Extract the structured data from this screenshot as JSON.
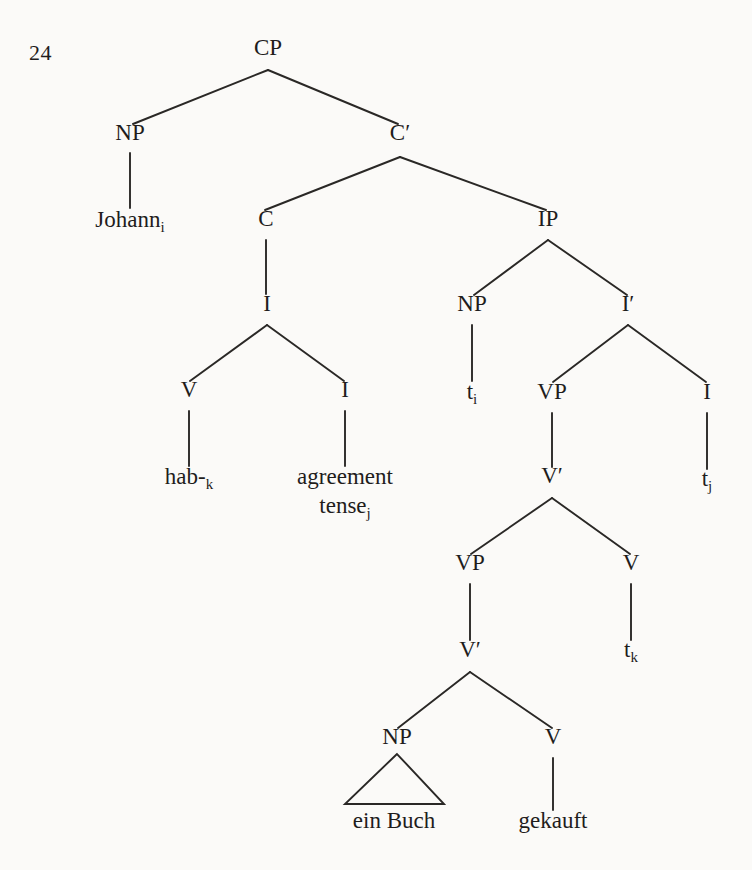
{
  "page": {
    "number": "24",
    "width": 752,
    "height": 870,
    "background_color": "#fbfaf8",
    "ink_color": "#1f1d1c"
  },
  "figure": {
    "type": "syntax-tree",
    "sentence": "Johann hab- agreement tense ein Buch gekauft",
    "nodes": [
      {
        "id": "cp",
        "label": "CP",
        "sub": "",
        "x": 268,
        "y": 55,
        "kind": "category"
      },
      {
        "id": "np1",
        "label": "NP",
        "sub": "",
        "x": 130,
        "y": 140,
        "kind": "category"
      },
      {
        "id": "johann",
        "label": "Johann",
        "sub": "i",
        "x": 130,
        "y": 227,
        "kind": "leaf"
      },
      {
        "id": "cbar",
        "label": "C′",
        "sub": "",
        "x": 400,
        "y": 140,
        "kind": "category"
      },
      {
        "id": "c",
        "label": "C",
        "sub": "",
        "x": 266,
        "y": 226,
        "kind": "category"
      },
      {
        "id": "ip",
        "label": "IP",
        "sub": "",
        "x": 548,
        "y": 226,
        "kind": "category"
      },
      {
        "id": "i1",
        "label": "I",
        "sub": "",
        "x": 267,
        "y": 311,
        "kind": "category"
      },
      {
        "id": "v1",
        "label": "V",
        "sub": "",
        "x": 189,
        "y": 397,
        "kind": "category"
      },
      {
        "id": "i2",
        "label": "I",
        "sub": "",
        "x": 345,
        "y": 397,
        "kind": "category"
      },
      {
        "id": "hab",
        "label": "hab-",
        "sub": "k",
        "x": 189,
        "y": 484,
        "kind": "leaf"
      },
      {
        "id": "agreement",
        "label": "agreement",
        "sub": "",
        "x": 345,
        "y": 484,
        "kind": "leaf"
      },
      {
        "id": "tense",
        "label": "tense",
        "sub": "j",
        "x": 345,
        "y": 513,
        "kind": "leaf"
      },
      {
        "id": "np2",
        "label": "NP",
        "sub": "",
        "x": 472,
        "y": 311,
        "kind": "category"
      },
      {
        "id": "ibar",
        "label": "I′",
        "sub": "",
        "x": 628,
        "y": 311,
        "kind": "category"
      },
      {
        "id": "ti",
        "label": "t",
        "sub": "i",
        "x": 472,
        "y": 399,
        "kind": "leaf"
      },
      {
        "id": "vp1",
        "label": "VP",
        "sub": "",
        "x": 552,
        "y": 399,
        "kind": "category"
      },
      {
        "id": "i3",
        "label": "I",
        "sub": "",
        "x": 707,
        "y": 399,
        "kind": "category"
      },
      {
        "id": "tj",
        "label": "t",
        "sub": "j",
        "x": 707,
        "y": 486,
        "kind": "leaf"
      },
      {
        "id": "vbar1",
        "label": "V′",
        "sub": "",
        "x": 552,
        "y": 483,
        "kind": "category"
      },
      {
        "id": "vp2",
        "label": "VP",
        "sub": "",
        "x": 470,
        "y": 570,
        "kind": "category"
      },
      {
        "id": "v2",
        "label": "V",
        "sub": "",
        "x": 631,
        "y": 570,
        "kind": "category"
      },
      {
        "id": "tk",
        "label": "t",
        "sub": "k",
        "x": 631,
        "y": 657,
        "kind": "leaf"
      },
      {
        "id": "vbar2",
        "label": "V′",
        "sub": "",
        "x": 470,
        "y": 657,
        "kind": "category"
      },
      {
        "id": "np3",
        "label": "NP",
        "sub": "",
        "x": 397,
        "y": 744,
        "kind": "category"
      },
      {
        "id": "v3",
        "label": "V",
        "sub": "",
        "x": 553,
        "y": 744,
        "kind": "category"
      },
      {
        "id": "einbuch",
        "label": "ein Buch",
        "sub": "",
        "x": 394,
        "y": 828,
        "kind": "leaf"
      },
      {
        "id": "gekauft",
        "label": "gekauft",
        "sub": "",
        "x": 553,
        "y": 828,
        "kind": "leaf"
      }
    ],
    "edges": [
      {
        "from": "cp",
        "to": "np1",
        "x1": 268,
        "y1": 70,
        "x2": 133,
        "y2": 124
      },
      {
        "from": "cp",
        "to": "cbar",
        "x1": 268,
        "y1": 70,
        "x2": 398,
        "y2": 124
      },
      {
        "from": "np1",
        "to": "johann",
        "x1": 130,
        "y1": 153,
        "x2": 130,
        "y2": 208
      },
      {
        "from": "cbar",
        "to": "c",
        "x1": 400,
        "y1": 157,
        "x2": 265,
        "y2": 210
      },
      {
        "from": "cbar",
        "to": "ip",
        "x1": 400,
        "y1": 157,
        "x2": 546,
        "y2": 210
      },
      {
        "from": "c",
        "to": "i1",
        "x1": 266,
        "y1": 240,
        "x2": 266,
        "y2": 294
      },
      {
        "from": "i1",
        "to": "v1",
        "x1": 267,
        "y1": 325,
        "x2": 190,
        "y2": 381
      },
      {
        "from": "i1",
        "to": "i2",
        "x1": 267,
        "y1": 325,
        "x2": 344,
        "y2": 381
      },
      {
        "from": "v1",
        "to": "hab",
        "x1": 189,
        "y1": 411,
        "x2": 189,
        "y2": 466
      },
      {
        "from": "i2",
        "to": "agreement",
        "x1": 345,
        "y1": 411,
        "x2": 345,
        "y2": 466
      },
      {
        "from": "ip",
        "to": "np2",
        "x1": 548,
        "y1": 240,
        "x2": 474,
        "y2": 295
      },
      {
        "from": "ip",
        "to": "ibar",
        "x1": 548,
        "y1": 240,
        "x2": 627,
        "y2": 295
      },
      {
        "from": "np2",
        "to": "ti",
        "x1": 472,
        "y1": 325,
        "x2": 472,
        "y2": 381
      },
      {
        "from": "ibar",
        "to": "vp1",
        "x1": 628,
        "y1": 325,
        "x2": 553,
        "y2": 382
      },
      {
        "from": "ibar",
        "to": "i3",
        "x1": 628,
        "y1": 325,
        "x2": 706,
        "y2": 382
      },
      {
        "from": "i3",
        "to": "tj",
        "x1": 707,
        "y1": 413,
        "x2": 707,
        "y2": 469
      },
      {
        "from": "vp1",
        "to": "vbar1",
        "x1": 552,
        "y1": 413,
        "x2": 552,
        "y2": 467
      },
      {
        "from": "vbar1",
        "to": "vp2",
        "x1": 552,
        "y1": 498,
        "x2": 471,
        "y2": 554
      },
      {
        "from": "vbar1",
        "to": "v2",
        "x1": 552,
        "y1": 498,
        "x2": 630,
        "y2": 554
      },
      {
        "from": "vp2",
        "to": "vbar2",
        "x1": 470,
        "y1": 584,
        "x2": 470,
        "y2": 640
      },
      {
        "from": "v2",
        "to": "tk",
        "x1": 631,
        "y1": 584,
        "x2": 631,
        "y2": 640
      },
      {
        "from": "vbar2",
        "to": "np3",
        "x1": 470,
        "y1": 672,
        "x2": 398,
        "y2": 728
      },
      {
        "from": "vbar2",
        "to": "v3",
        "x1": 470,
        "y1": 672,
        "x2": 552,
        "y2": 728
      },
      {
        "from": "v3",
        "to": "gekauft",
        "x1": 553,
        "y1": 758,
        "x2": 553,
        "y2": 810
      }
    ],
    "triangles": [
      {
        "under": "np3",
        "apex_x": 397,
        "apex_y": 754,
        "left_x": 345,
        "right_x": 444,
        "base_y": 804
      }
    ]
  }
}
